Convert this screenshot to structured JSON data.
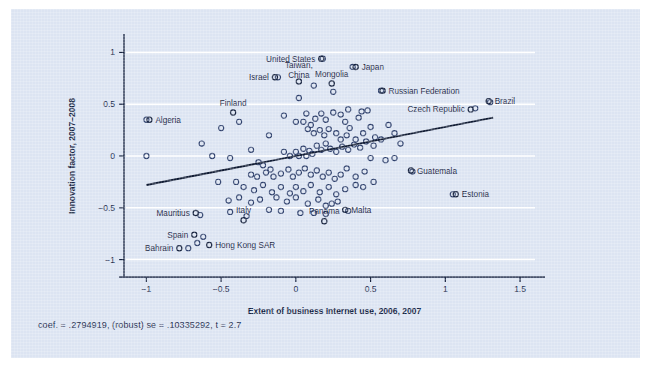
{
  "figure": {
    "background_color": "#dce4f2",
    "ink_color": "#17233f",
    "gridline_color": "#ffffff"
  },
  "caption": "coef. = .2794919, (robust) se = .10335292, t = 2.7",
  "chart_data": {
    "type": "scatter",
    "title": "",
    "xlabel": "Extent of business Internet use, 2006, 2007",
    "ylabel": "Innovation factor, 2007–2008",
    "xlim": [
      -1.15,
      1.6
    ],
    "ylim": [
      -1.12,
      1.12
    ],
    "xticks": [
      -1,
      -0.5,
      0,
      0.5,
      1,
      1.5
    ],
    "xticklabels": [
      "−1",
      "−0.5",
      "0",
      "0.5",
      "1",
      "1.5"
    ],
    "yticks": [
      -1,
      -0.5,
      0,
      0.5,
      1
    ],
    "yticklabels": [
      "−1",
      "−0.5",
      "0",
      "0.5",
      "1"
    ],
    "grid": "horizontal-white-at-yticks",
    "legend": "none",
    "marker": "open-circle",
    "fit_line": {
      "type": "linear-robust-fit",
      "coef": 0.2794919,
      "robust_se": 0.10335292,
      "t": 2.7,
      "x_start": -1.0,
      "y_start": -0.28,
      "x_end": 1.32,
      "y_end": 0.37
    },
    "annotations": [
      {
        "label": "United States",
        "x": 0.17,
        "y": 0.94,
        "anchor": "end"
      },
      {
        "label": "Japan",
        "x": 0.4,
        "y": 0.86,
        "anchor": "start"
      },
      {
        "label": "Taiwan, China",
        "x": 0.02,
        "y": 0.72,
        "anchor": "middle",
        "multiline": true
      },
      {
        "label": "Israel",
        "x": -0.14,
        "y": 0.76,
        "anchor": "end"
      },
      {
        "label": "Mongolia",
        "x": 0.24,
        "y": 0.7,
        "anchor": "middle"
      },
      {
        "label": "Russian Federation",
        "x": 0.58,
        "y": 0.63,
        "anchor": "start"
      },
      {
        "label": "Brazil",
        "x": 1.29,
        "y": 0.53,
        "anchor": "start"
      },
      {
        "label": "Czech Republic",
        "x": 1.17,
        "y": 0.45,
        "anchor": "end"
      },
      {
        "label": "Algeria",
        "x": -0.98,
        "y": 0.35,
        "anchor": "start"
      },
      {
        "label": "Finland",
        "x": -0.42,
        "y": 0.42,
        "anchor": "middle"
      },
      {
        "label": "Guatemala",
        "x": 0.77,
        "y": -0.14,
        "anchor": "start"
      },
      {
        "label": "Estonia",
        "x": 1.07,
        "y": -0.37,
        "anchor": "start"
      },
      {
        "label": "Malta",
        "x": 0.33,
        "y": -0.52,
        "anchor": "start"
      },
      {
        "label": "Mauritius",
        "x": -0.67,
        "y": -0.55,
        "anchor": "end"
      },
      {
        "label": "Italy",
        "x": -0.35,
        "y": -0.62,
        "anchor": "middle"
      },
      {
        "label": "Panama",
        "x": 0.19,
        "y": -0.63,
        "anchor": "middle"
      },
      {
        "label": "Spain",
        "x": -0.68,
        "y": -0.76,
        "anchor": "end"
      },
      {
        "label": "Hong Kong SAR",
        "x": -0.58,
        "y": -0.86,
        "anchor": "start"
      },
      {
        "label": "Bahrain",
        "x": -0.78,
        "y": -0.89,
        "anchor": "end"
      }
    ],
    "points": [
      [
        0.18,
        0.94
      ],
      [
        0.38,
        0.86
      ],
      [
        0.02,
        0.56
      ],
      [
        0.12,
        0.68
      ],
      [
        -0.12,
        0.76
      ],
      [
        0.25,
        0.62
      ],
      [
        0.57,
        0.63
      ],
      [
        1.3,
        0.52
      ],
      [
        1.2,
        0.46
      ],
      [
        -1.0,
        0.35
      ],
      [
        -0.38,
        0.33
      ],
      [
        -0.5,
        0.27
      ],
      [
        -0.63,
        0.12
      ],
      [
        -0.56,
        0.0
      ],
      [
        -1.0,
        0.0
      ],
      [
        -0.44,
        -0.02
      ],
      [
        -0.3,
        0.06
      ],
      [
        -0.18,
        0.2
      ],
      [
        -0.08,
        0.39
      ],
      [
        0.0,
        0.33
      ],
      [
        0.07,
        0.41
      ],
      [
        0.05,
        0.33
      ],
      [
        0.1,
        0.3
      ],
      [
        0.13,
        0.36
      ],
      [
        0.17,
        0.41
      ],
      [
        0.2,
        0.35
      ],
      [
        0.25,
        0.42
      ],
      [
        0.3,
        0.4
      ],
      [
        0.33,
        0.33
      ],
      [
        0.36,
        0.27
      ],
      [
        0.42,
        0.37
      ],
      [
        0.44,
        0.43
      ],
      [
        0.48,
        0.44
      ],
      [
        0.35,
        0.45
      ],
      [
        0.08,
        0.26
      ],
      [
        0.12,
        0.22
      ],
      [
        0.16,
        0.25
      ],
      [
        0.19,
        0.2
      ],
      [
        0.22,
        0.26
      ],
      [
        0.27,
        0.22
      ],
      [
        0.3,
        0.16
      ],
      [
        0.34,
        0.2
      ],
      [
        0.4,
        0.16
      ],
      [
        0.45,
        0.22
      ],
      [
        0.5,
        0.28
      ],
      [
        0.53,
        0.18
      ],
      [
        -0.25,
        -0.06
      ],
      [
        -0.22,
        -0.09
      ],
      [
        -0.17,
        -0.13
      ],
      [
        -0.08,
        0.04
      ],
      [
        -0.04,
        0.0
      ],
      [
        0.0,
        0.04
      ],
      [
        0.02,
        0.0
      ],
      [
        0.05,
        0.07
      ],
      [
        0.07,
        0.0
      ],
      [
        0.09,
        0.05
      ],
      [
        0.11,
        0.02
      ],
      [
        0.14,
        0.1
      ],
      [
        0.17,
        0.06
      ],
      [
        0.2,
        0.12
      ],
      [
        0.23,
        0.07
      ],
      [
        0.27,
        0.04
      ],
      [
        0.31,
        0.09
      ],
      [
        0.35,
        0.06
      ],
      [
        0.39,
        0.11
      ],
      [
        0.43,
        0.08
      ],
      [
        0.47,
        0.14
      ],
      [
        0.52,
        0.1
      ],
      [
        0.57,
        0.16
      ],
      [
        -0.3,
        -0.18
      ],
      [
        -0.26,
        -0.2
      ],
      [
        -0.2,
        -0.16
      ],
      [
        -0.15,
        -0.2
      ],
      [
        -0.1,
        -0.17
      ],
      [
        -0.05,
        -0.13
      ],
      [
        -0.02,
        -0.2
      ],
      [
        0.02,
        -0.16
      ],
      [
        0.06,
        -0.12
      ],
      [
        0.1,
        -0.18
      ],
      [
        0.14,
        -0.14
      ],
      [
        0.18,
        -0.2
      ],
      [
        0.22,
        -0.16
      ],
      [
        0.26,
        -0.22
      ],
      [
        0.3,
        -0.18
      ],
      [
        0.34,
        -0.12
      ],
      [
        0.4,
        -0.2
      ],
      [
        0.46,
        -0.15
      ],
      [
        0.52,
        -0.25
      ],
      [
        -0.4,
        -0.25
      ],
      [
        -0.35,
        -0.3
      ],
      [
        -0.28,
        -0.33
      ],
      [
        -0.22,
        -0.28
      ],
      [
        -0.16,
        -0.35
      ],
      [
        -0.1,
        -0.3
      ],
      [
        -0.04,
        -0.36
      ],
      [
        0.0,
        -0.3
      ],
      [
        0.05,
        -0.34
      ],
      [
        0.1,
        -0.28
      ],
      [
        0.16,
        -0.35
      ],
      [
        0.22,
        -0.3
      ],
      [
        0.27,
        -0.37
      ],
      [
        0.33,
        -0.32
      ],
      [
        0.4,
        -0.28
      ],
      [
        -0.45,
        -0.43
      ],
      [
        -0.38,
        -0.4
      ],
      [
        -0.3,
        -0.45
      ],
      [
        -0.24,
        -0.42
      ],
      [
        -0.13,
        -0.4
      ],
      [
        -0.06,
        -0.44
      ],
      [
        0.0,
        -0.4
      ],
      [
        0.08,
        -0.46
      ],
      [
        0.15,
        -0.42
      ],
      [
        0.2,
        -0.48
      ],
      [
        0.28,
        -0.44
      ],
      [
        -0.44,
        -0.54
      ],
      [
        -0.33,
        -0.58
      ],
      [
        -0.64,
        -0.57
      ],
      [
        0.03,
        -0.55
      ],
      [
        0.12,
        -0.55
      ],
      [
        0.2,
        -0.56
      ],
      [
        0.35,
        -0.53
      ],
      [
        0.24,
        -0.46
      ],
      [
        -0.18,
        -0.52
      ],
      [
        -0.1,
        -0.53
      ],
      [
        0.78,
        -0.15
      ],
      [
        1.05,
        -0.37
      ],
      [
        -0.62,
        -0.78
      ],
      [
        -0.66,
        -0.84
      ],
      [
        -0.72,
        -0.89
      ],
      [
        -0.52,
        -0.25
      ],
      [
        0.62,
        0.3
      ],
      [
        0.66,
        0.22
      ],
      [
        0.7,
        0.12
      ],
      [
        0.6,
        -0.04
      ],
      [
        0.66,
        -0.02
      ],
      [
        0.45,
        -0.3
      ],
      [
        0.5,
        -0.02
      ]
    ]
  }
}
